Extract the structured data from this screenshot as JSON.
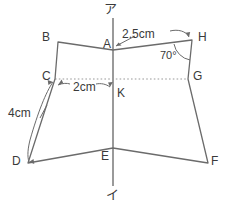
{
  "figure": {
    "stroke_color": "#6b6b6b",
    "dotted_color": "#9a9a9a",
    "axis_color": "#9a9a9a",
    "text_color": "#3a3a3a",
    "background": "#ffffff",
    "axis": {
      "top_label": "ア",
      "bottom_label": "イ",
      "x": 113,
      "y_top": 18,
      "y_bottom": 186
    },
    "vertices": [
      {
        "id": "B",
        "label": "B",
        "x": 58,
        "y": 42,
        "label_x": 42,
        "label_y": 31
      },
      {
        "id": "A",
        "label": "A",
        "x": 113,
        "y": 50,
        "label_x": 103,
        "label_y": 38
      },
      {
        "id": "H",
        "label": "H",
        "x": 192,
        "y": 40,
        "label_x": 198,
        "label_y": 31
      },
      {
        "id": "G",
        "label": "G",
        "x": 188,
        "y": 79,
        "label_x": 193,
        "label_y": 70
      },
      {
        "id": "F",
        "label": "F",
        "x": 208,
        "y": 163,
        "label_x": 211,
        "label_y": 155
      },
      {
        "id": "E",
        "label": "E",
        "x": 113,
        "y": 148,
        "label_x": 101,
        "label_y": 150
      },
      {
        "id": "D",
        "label": "D",
        "x": 28,
        "y": 163,
        "label_x": 12,
        "label_y": 155
      },
      {
        "id": "C",
        "label": "C",
        "x": 55,
        "y": 79,
        "label_x": 42,
        "label_y": 70
      },
      {
        "id": "K",
        "label": "K",
        "x": 113,
        "y": 79,
        "label_x": 117,
        "label_y": 87
      }
    ],
    "outline_order": [
      "B",
      "A",
      "H",
      "G",
      "F",
      "E",
      "D",
      "C"
    ],
    "dotted_segment": {
      "from": "C",
      "to": "G",
      "through": "K"
    },
    "measurements": [
      {
        "id": "ah",
        "label": "2.5cm",
        "x": 122,
        "y": 33,
        "segment": "A-H"
      },
      {
        "id": "ck",
        "label": "2cm",
        "x": 73,
        "y": 86,
        "segment": "C-K"
      },
      {
        "id": "cd",
        "label": "4cm",
        "x": 10,
        "y": 112,
        "segment": "C-D"
      }
    ],
    "angle": {
      "id": "angle-h",
      "label": "70°",
      "x": 162,
      "y": 55,
      "at_vertex": "H"
    }
  }
}
